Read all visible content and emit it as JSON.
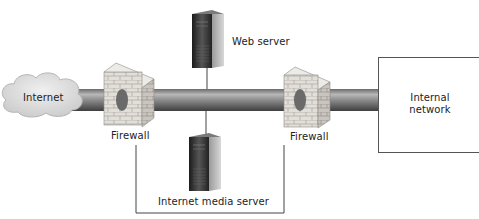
{
  "diagram": {
    "nodes": [
      {
        "id": "internet",
        "label": "Internet",
        "shape": "cloud"
      },
      {
        "id": "firewall_1",
        "label": "Firewall",
        "shape": "brick-wall"
      },
      {
        "id": "web_server",
        "label": "Web server",
        "shape": "server-tower"
      },
      {
        "id": "media_server",
        "label": "Internet media server",
        "shape": "server-tower"
      },
      {
        "id": "firewall_2",
        "label": "Firewall",
        "shape": "brick-wall"
      },
      {
        "id": "internal_network",
        "label": "Internal network",
        "shape": "rectangle"
      }
    ],
    "edges": [
      {
        "from": "internet",
        "to": "firewall_1",
        "style": "pipe"
      },
      {
        "from": "firewall_1",
        "to": "firewall_2",
        "style": "pipe"
      },
      {
        "from": "firewall_2",
        "to": "internal_network",
        "style": "pipe"
      },
      {
        "from": "web_server",
        "to": "pipe",
        "style": "line"
      },
      {
        "from": "media_server",
        "to": "pipe",
        "style": "line"
      },
      {
        "from": "firewall_1",
        "to": "firewall_2",
        "style": "bracket-line-below"
      }
    ]
  },
  "labels": {
    "internet": "Internet",
    "firewall_left": "Firewall",
    "firewall_right": "Firewall",
    "web_server": "Web server",
    "media_server": "Internet media server",
    "internal_line1": "Internal",
    "internal_line2": "network"
  },
  "colors": {
    "pipe_dark": "#4a4a4a",
    "pipe_light": "#b5b5b5",
    "cloud": "#d8d8d8",
    "brick": "#d9d6d0",
    "server_dark": "#2a2a2a",
    "line": "#444444"
  }
}
